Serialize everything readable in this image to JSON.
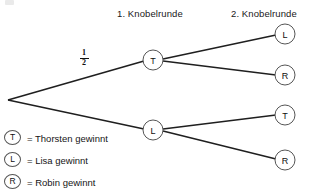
{
  "diagram": {
    "type": "probability-tree",
    "title_visible": false,
    "headers": [
      {
        "id": "round-1",
        "label": "1. Knobelrunde"
      },
      {
        "id": "round-2",
        "label": "2. Knobelrunde"
      }
    ],
    "root": {
      "id": "root",
      "label": "",
      "x": 8,
      "y": 100
    },
    "nodes": [
      {
        "id": "n-t",
        "label": "T",
        "x": 153,
        "y": 60,
        "level": 1
      },
      {
        "id": "n-l",
        "label": "L",
        "x": 153,
        "y": 130,
        "level": 1
      },
      {
        "id": "n-t-l",
        "label": "L",
        "x": 285,
        "y": 34,
        "level": 2
      },
      {
        "id": "n-t-r",
        "label": "R",
        "x": 285,
        "y": 75,
        "level": 2
      },
      {
        "id": "n-l-t",
        "label": "T",
        "x": 285,
        "y": 115,
        "level": 2
      },
      {
        "id": "n-l-r",
        "label": "R",
        "x": 285,
        "y": 160,
        "level": 2
      }
    ],
    "edges": [
      {
        "id": "e-root-t",
        "from": "root",
        "to": "n-t",
        "label": "1/2"
      },
      {
        "id": "e-root-l",
        "from": "root",
        "to": "n-l",
        "label": ""
      },
      {
        "id": "e-t-l",
        "from": "n-t",
        "to": "n-t-l",
        "label": ""
      },
      {
        "id": "e-t-r",
        "from": "n-t",
        "to": "n-t-r",
        "label": ""
      },
      {
        "id": "e-l-t",
        "from": "n-l",
        "to": "n-l-t",
        "label": ""
      },
      {
        "id": "e-l-r",
        "from": "n-l",
        "to": "n-l-r",
        "label": ""
      }
    ],
    "edge_label": {
      "numerator": "1",
      "denominator": "2"
    },
    "colors": {
      "stroke": "#1f1f1f",
      "node_ring": "#555555",
      "text": "#151515",
      "background": "#ffffff"
    }
  },
  "legend": {
    "items": [
      {
        "id": "legend-t",
        "symbol": "T",
        "text": "= Thorsten gewinnt"
      },
      {
        "id": "legend-l",
        "symbol": "L",
        "text": "= Lisa gewinnt"
      },
      {
        "id": "legend-r",
        "symbol": "R",
        "text": "= Robin gewinnt"
      }
    ]
  }
}
